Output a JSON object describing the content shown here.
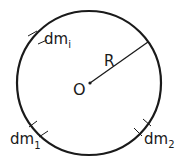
{
  "diagram": {
    "type": "ring-mass-elements",
    "colors": {
      "stroke": "#1a1a1a",
      "background": "#ffffff"
    },
    "circle": {
      "cx": 89,
      "cy": 83,
      "r": 72
    },
    "center": {
      "label": "O",
      "x": 90,
      "y": 83
    },
    "radius": {
      "label": "R",
      "x2": 148,
      "y2": 42
    },
    "elements": [
      {
        "name": "dm-i",
        "base": "dm",
        "sub": "i",
        "angle_deg": -130
      },
      {
        "name": "dm-1",
        "base": "dm",
        "sub": "1",
        "angle_deg": 140
      },
      {
        "name": "dm-2",
        "base": "dm",
        "sub": "2",
        "angle_deg": 40
      }
    ]
  }
}
